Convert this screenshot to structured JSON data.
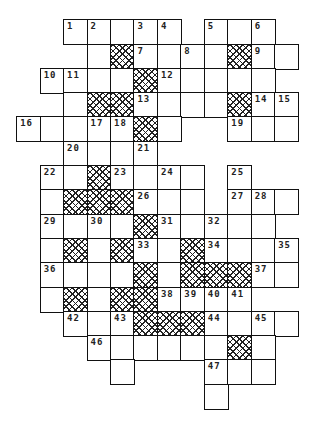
{
  "puzzle": {
    "type": "crossword",
    "columns": 13,
    "rows": 16,
    "origin_x": 17,
    "origin_y": 20,
    "pitch_x": 23.45,
    "pitch_y": 24.3,
    "legend": {
      "W": "white cell",
      "X": "hatched (blocked) cell",
      "number": "numbered white cell",
      ".": "no cell"
    },
    "grid": [
      [
        ".",
        ".",
        "1",
        "2",
        "W",
        "3",
        "4",
        ".",
        "5",
        "W",
        "6",
        ".",
        "."
      ],
      [
        ".",
        ".",
        ".",
        "W",
        "X",
        "7",
        "W",
        "8",
        "W",
        "X",
        "9",
        "W",
        "."
      ],
      [
        ".",
        "10",
        "11",
        "W",
        "W",
        "X",
        "12",
        "W",
        "W",
        "W",
        "W",
        ".",
        "."
      ],
      [
        ".",
        ".",
        "W",
        "X",
        "X",
        "13",
        "W",
        "W",
        "W",
        "X",
        "14",
        "15",
        "."
      ],
      [
        "16",
        "W",
        "W",
        "17",
        "18",
        "X",
        "W",
        ".",
        ".",
        "19",
        "W",
        "W",
        "."
      ],
      [
        ".",
        ".",
        "20",
        "W",
        "W",
        "21",
        ".",
        ".",
        ".",
        ".",
        ".",
        ".",
        "."
      ],
      [
        ".",
        "22",
        "W",
        "X",
        "23",
        "W",
        "24",
        "W",
        ".",
        "25",
        ".",
        ".",
        "."
      ],
      [
        ".",
        "W",
        "X",
        "X",
        "X",
        "26",
        "W",
        "W",
        ".",
        "27",
        "28",
        "W",
        "."
      ],
      [
        ".",
        "29",
        "W",
        "30",
        "W",
        "X",
        "31",
        "W",
        "32",
        "W",
        "W",
        ".",
        "."
      ],
      [
        ".",
        "W",
        "X",
        "W",
        "X",
        "33",
        "W",
        "X",
        "34",
        "W",
        "W",
        "35",
        "."
      ],
      [
        ".",
        "36",
        "W",
        "W",
        "W",
        "X",
        "W",
        "X",
        "X",
        "X",
        "37",
        "W",
        "."
      ],
      [
        ".",
        "W",
        "X",
        "W",
        "X",
        "X",
        "38",
        "39",
        "40",
        "41",
        ".",
        ".",
        "."
      ],
      [
        ".",
        ".",
        "42",
        "W",
        "43",
        "X",
        "X",
        "X",
        "44",
        "W",
        "45",
        "W",
        "."
      ],
      [
        ".",
        ".",
        ".",
        "46",
        "W",
        "W",
        "W",
        "W",
        "W",
        "X",
        "W",
        ".",
        "."
      ],
      [
        ".",
        ".",
        ".",
        ".",
        "W",
        ".",
        ".",
        ".",
        "47",
        "W",
        "W",
        ".",
        "."
      ],
      [
        ".",
        ".",
        ".",
        ".",
        ".",
        ".",
        ".",
        ".",
        "W",
        ".",
        ".",
        ".",
        "."
      ]
    ],
    "clue_numbers": [
      1,
      2,
      3,
      4,
      5,
      6,
      7,
      8,
      9,
      10,
      11,
      12,
      13,
      14,
      15,
      16,
      17,
      18,
      19,
      20,
      21,
      22,
      23,
      24,
      25,
      26,
      27,
      28,
      29,
      30,
      31,
      32,
      33,
      34,
      35,
      36,
      37,
      38,
      39,
      40,
      41,
      42,
      43,
      44,
      45,
      46,
      47
    ],
    "colors": {
      "border": "#111111",
      "hatch": "#222222",
      "background": "#ffffff",
      "number": "#222222"
    }
  }
}
